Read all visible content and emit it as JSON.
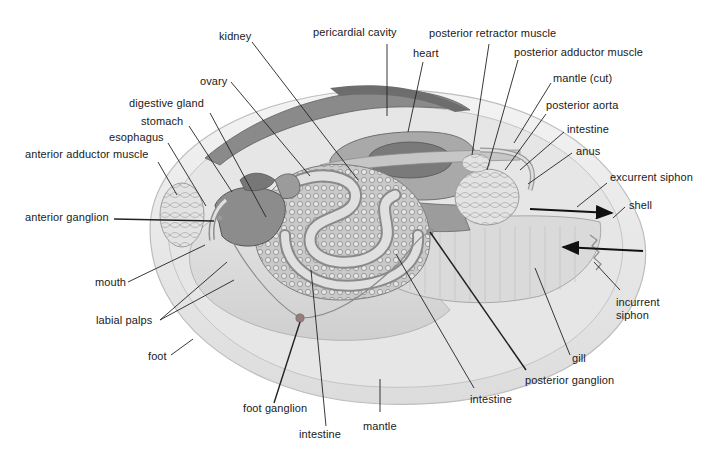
{
  "diagram": {
    "colors": {
      "shell": "#ebebeb",
      "mantle": "#e2e2e2",
      "foot": "#d8d8d8",
      "organ_dark": "#7a7a7a",
      "organ_mid": "#a9a9a9",
      "gonad_texture": "#9c9c9c",
      "leader_line": "#222222",
      "arrow": "#111111",
      "mantle_top_muscle": "#6d6d6d"
    },
    "labels": {
      "kidney": "kidney",
      "pericardial_cavity": "pericardial cavity",
      "posterior_retractor_muscle": "posterior retractor muscle",
      "heart": "heart",
      "posterior_adductor_muscle": "posterior adductor muscle",
      "mantle_cut": "mantle (cut)",
      "posterior_aorta": "posterior aorta",
      "intestine_top": "intestine",
      "anus": "anus",
      "excurrent_siphon": "excurrent siphon",
      "shell": "shell",
      "ovary": "ovary",
      "digestive_gland": "digestive gland",
      "stomach": "stomach",
      "esophagus": "esophagus",
      "anterior_adductor_muscle": "anterior adductor muscle",
      "anterior_ganglion": "anterior ganglion",
      "mouth": "mouth",
      "labial_palps": "labial palps",
      "foot": "foot",
      "foot_ganglion": "foot ganglion",
      "intestine_bottom": "intestine",
      "mantle": "mantle",
      "intestine_mid": "intestine",
      "posterior_ganglion": "posterior ganglion",
      "gill": "gill",
      "incurrent_siphon": "incurrent\nsiphon"
    },
    "arrows": [
      {
        "name": "excurrent-flow",
        "direction": "out"
      },
      {
        "name": "incurrent-flow",
        "direction": "in"
      }
    ]
  }
}
